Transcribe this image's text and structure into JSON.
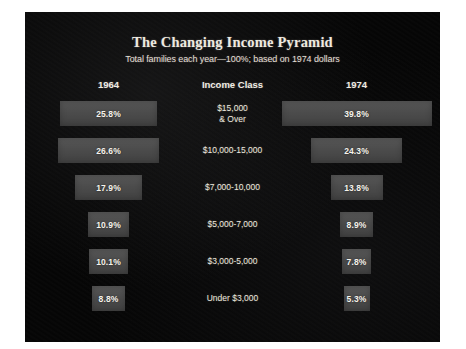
{
  "chart_data": {
    "type": "bar",
    "title": "The Changing Income Pyramid",
    "subtitle": "Total families each year—100%; based on 1974 dollars",
    "xlabel": "",
    "ylabel": "Income Class",
    "legend_position": "top",
    "grid": false,
    "orientation": "horizontal-diverging",
    "categories": [
      "$15,000 & Over",
      "$10,000-15,000",
      "$7,000-10,000",
      "$5,000-7,000",
      "$3,000-5,000",
      "Under $3,000"
    ],
    "series": [
      {
        "name": "1964",
        "values": [
          25.8,
          26.6,
          17.9,
          10.9,
          10.1,
          8.8
        ]
      },
      {
        "name": "1974",
        "values": [
          39.8,
          24.3,
          13.8,
          8.9,
          7.8,
          5.3
        ]
      }
    ]
  },
  "headers": {
    "left": "1964",
    "center": "Income Class",
    "right": "1974"
  },
  "rows": [
    {
      "class_line1": "$15,000",
      "class_line2": "& Over",
      "left_label": "25.8%",
      "right_label": "39.8%"
    },
    {
      "class_line1": "$10,000-15,000",
      "class_line2": "",
      "left_label": "26.6%",
      "right_label": "24.3%"
    },
    {
      "class_line1": "$7,000-10,000",
      "class_line2": "",
      "left_label": "17.9%",
      "right_label": "13.8%"
    },
    {
      "class_line1": "$5,000-7,000",
      "class_line2": "",
      "left_label": "10.9%",
      "right_label": "8.9%"
    },
    {
      "class_line1": "$3,000-5,000",
      "class_line2": "",
      "left_label": "10.1%",
      "right_label": "7.8%"
    },
    {
      "class_line1": "Under $3,000",
      "class_line2": "",
      "left_label": "8.8%",
      "right_label": "5.3%"
    }
  ],
  "colors": {
    "background": "#050505",
    "bar": "#4c4c4c",
    "text": "#f0ece4",
    "slide_border": "#ffffff"
  }
}
